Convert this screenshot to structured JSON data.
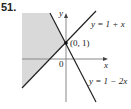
{
  "problem_number": "51.",
  "axes": {
    "x_label": "x",
    "y_label": "y",
    "origin_label": "0"
  },
  "point": {
    "label": "(0, 1)",
    "x": 0,
    "y": 1
  },
  "lines": [
    {
      "label": "y = 1 + x",
      "equation": "y=1+x"
    },
    {
      "label": "y = 1 − 2x",
      "equation": "y=1-2x"
    }
  ],
  "shaded_region": "y >= 1 + x and y <= 1 - 2x",
  "colors": {
    "shade": "#d9d9d9",
    "line": "#222222",
    "axis": "#999999"
  }
}
